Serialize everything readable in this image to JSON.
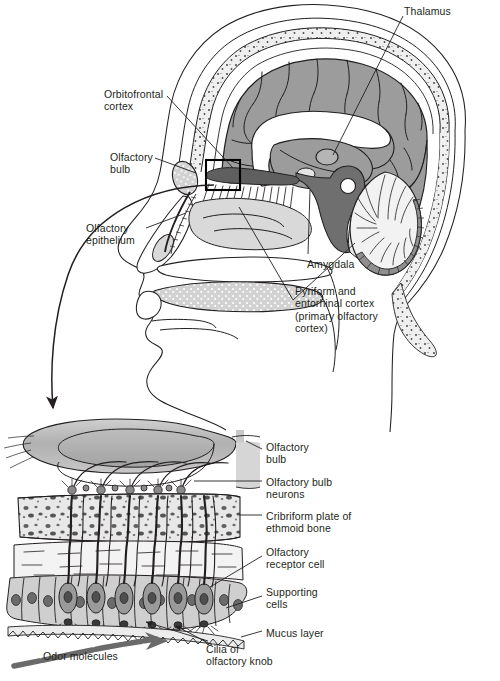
{
  "figure": {
    "background_color": "#ffffff",
    "palette": {
      "ink": "#231f20",
      "cortex_grey": "#9c9c9c",
      "deep_grey": "#6f6f6f",
      "mid_grey": "#bdbdbd",
      "light_grey": "#d9d9d9",
      "pale_grey": "#ebebeb",
      "white": "#ffffff",
      "bulb_grey": "#b3b3b3",
      "cell_grey": "#a8a8a8",
      "nucleus_grey": "#6b6b6b"
    }
  },
  "upper_panel": {
    "name": "sagittal-head-section",
    "labels": [
      {
        "id": "thalamus",
        "text": "Thalamus",
        "x": 404,
        "y": 5,
        "align": "left"
      },
      {
        "id": "orbitofrontal",
        "text": "Orbitofrontal\ncortex",
        "x": 104,
        "y": 88,
        "align": "left"
      },
      {
        "id": "olfactory-bulb",
        "text": "Olfactory\nbulb",
        "x": 110,
        "y": 151,
        "align": "left"
      },
      {
        "id": "olfactory-epithelium",
        "text": "Olfactory\nepithelium",
        "x": 86,
        "y": 222,
        "align": "left"
      },
      {
        "id": "amygdala",
        "text": "Amygdala",
        "x": 307,
        "y": 258,
        "align": "left"
      },
      {
        "id": "pyriform",
        "text": "Pyriform and\nentorhinal cortex\n(primary olfactory\ncortex)",
        "x": 295,
        "y": 285,
        "align": "left"
      }
    ]
  },
  "lower_panel": {
    "name": "olfactory-epithelium-detail",
    "labels": [
      {
        "id": "olfactory-bulb-2",
        "text": "Olfactory\nbulb",
        "x": 266,
        "y": 441,
        "align": "left"
      },
      {
        "id": "olfactory-bulb-neurons",
        "text": "Olfactory bulb\nneurons",
        "x": 266,
        "y": 476,
        "align": "left"
      },
      {
        "id": "cribriform-plate",
        "text": "Cribriform plate of\nethmoid bone",
        "x": 266,
        "y": 510,
        "align": "left"
      },
      {
        "id": "olfactory-receptor-cell",
        "text": "Olfactory\nreceptor cell",
        "x": 266,
        "y": 546,
        "align": "left"
      },
      {
        "id": "supporting-cells",
        "text": "Supporting\ncells",
        "x": 266,
        "y": 586,
        "align": "left"
      },
      {
        "id": "mucus-layer",
        "text": "Mucus layer",
        "x": 266,
        "y": 627,
        "align": "left"
      },
      {
        "id": "cilia-knob",
        "text": "Cilia of\nolfactory knob",
        "x": 206,
        "y": 643,
        "align": "left"
      },
      {
        "id": "odor-molecules",
        "text": "Odor molecules",
        "x": 43,
        "y": 650,
        "align": "left"
      }
    ]
  }
}
